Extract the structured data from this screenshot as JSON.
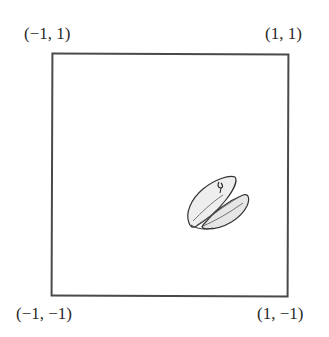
{
  "figure": {
    "corners": {
      "top_left": "(−1, 1)",
      "top_right": "(1, 1)",
      "bottom_left": "(−1, −1)",
      "bottom_right": "(1, −1)"
    },
    "object": {
      "name": "mussel-shell",
      "approx_position": "lower-right quadrant"
    },
    "colors": {
      "border": "#4a4a4a",
      "text": "#2a2a2a",
      "shell_fill": "#e8e8e8",
      "shell_stroke": "#333333"
    }
  }
}
